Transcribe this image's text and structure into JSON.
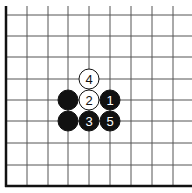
{
  "diagram": {
    "type": "go-board-corner",
    "colors": {
      "background": "#ffffff",
      "grid_line": "#555555",
      "edge_line": "#111111",
      "black_stone": "#111111",
      "white_stone": "#ffffff",
      "black_label": "#ffffff",
      "white_label": "#111111"
    },
    "grid": {
      "vertical_x": [
        27,
        48,
        68,
        89,
        110,
        131,
        152,
        173
      ],
      "horizontal_y": [
        15,
        36,
        57,
        79,
        100,
        121,
        143,
        165
      ],
      "left_edge_x": 6,
      "bottom_edge_y": 186
    },
    "stones": [
      {
        "color": "white",
        "label": "4",
        "x": 89,
        "y": 79
      },
      {
        "color": "black",
        "label": "",
        "x": 68,
        "y": 100
      },
      {
        "color": "white",
        "label": "2",
        "x": 89,
        "y": 100
      },
      {
        "color": "black",
        "label": "1",
        "x": 110,
        "y": 100
      },
      {
        "color": "black",
        "label": "",
        "x": 68,
        "y": 121
      },
      {
        "color": "black",
        "label": "3",
        "x": 89,
        "y": 121
      },
      {
        "color": "black",
        "label": "5",
        "x": 110,
        "y": 121
      }
    ]
  }
}
